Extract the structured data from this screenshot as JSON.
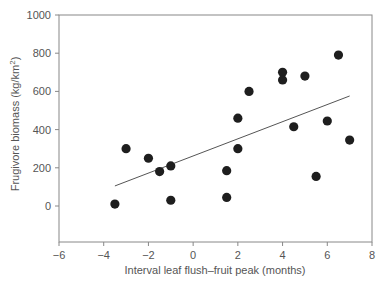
{
  "chart_data": {
    "type": "scatter",
    "title": "",
    "xlabel": "Interval leaf flush–fruit peak (months)",
    "ylabel": "Frugivore biomass (kg/km²)",
    "xlim": [
      -6,
      8
    ],
    "ylim": [
      -190,
      1000
    ],
    "xticks": [
      -6,
      -4,
      -2,
      0,
      2,
      4,
      6,
      8
    ],
    "yticks": [
      0,
      200,
      400,
      600,
      800,
      1000
    ],
    "grid": false,
    "legend": null,
    "points": [
      {
        "x": -3.5,
        "y": 10
      },
      {
        "x": -3.0,
        "y": 300
      },
      {
        "x": -2.0,
        "y": 250
      },
      {
        "x": -1.5,
        "y": 180
      },
      {
        "x": -1.0,
        "y": 210
      },
      {
        "x": -1.0,
        "y": 30
      },
      {
        "x": 1.5,
        "y": 45
      },
      {
        "x": 1.5,
        "y": 185
      },
      {
        "x": 2.0,
        "y": 300
      },
      {
        "x": 2.0,
        "y": 460
      },
      {
        "x": 2.5,
        "y": 600
      },
      {
        "x": 4.0,
        "y": 700
      },
      {
        "x": 4.0,
        "y": 660
      },
      {
        "x": 4.5,
        "y": 415
      },
      {
        "x": 5.0,
        "y": 680
      },
      {
        "x": 5.5,
        "y": 155
      },
      {
        "x": 6.0,
        "y": 445
      },
      {
        "x": 6.5,
        "y": 790
      },
      {
        "x": 7.0,
        "y": 345
      }
    ],
    "trendline": {
      "x1": -3.5,
      "y1": 105,
      "x2": 7.0,
      "y2": 576
    }
  },
  "labels": {
    "xlabel": "Interval leaf flush–fruit peak (months)",
    "ylabel_main": "Frugivore biomass (kg/km",
    "ylabel_sup": "2",
    "ylabel_end": ")"
  }
}
